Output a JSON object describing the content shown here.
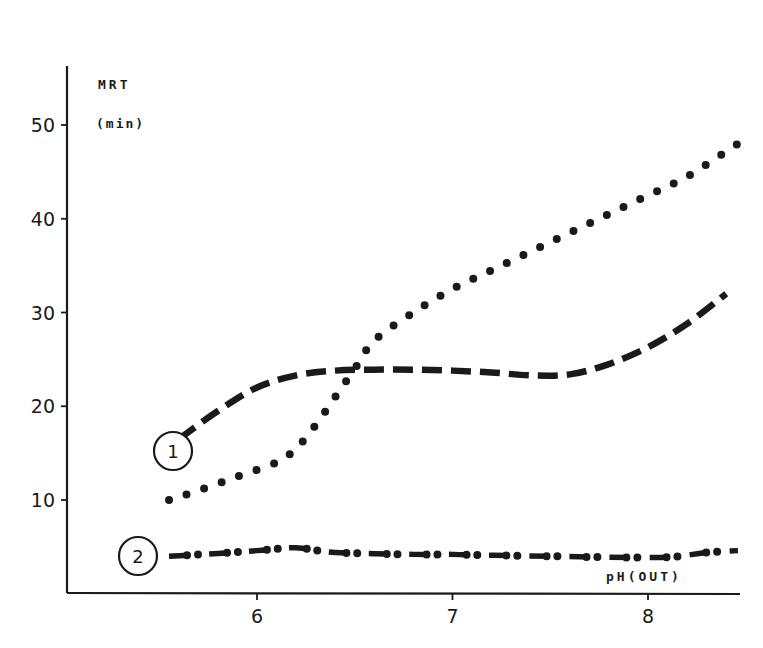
{
  "chart_data": {
    "type": "line",
    "title": "",
    "xlabel": "pH(OUT)",
    "ylabel": "MRT",
    "ylabel_unit": "(min)",
    "xlim": [
      5.05,
      8.5
    ],
    "ylim": [
      0,
      58
    ],
    "x_ticks": [
      6,
      7,
      8
    ],
    "y_ticks": [
      10,
      20,
      30,
      40,
      50
    ],
    "grid": false,
    "legend_position": "inline circled labels",
    "series": [
      {
        "name": "1",
        "style": "dashed",
        "label_at": [
          5.45,
          15.0
        ],
        "points": [
          [
            5.6,
            16.5
          ],
          [
            5.8,
            19.5
          ],
          [
            6.0,
            22.0
          ],
          [
            6.2,
            23.3
          ],
          [
            6.4,
            23.8
          ],
          [
            6.6,
            23.9
          ],
          [
            6.8,
            23.9
          ],
          [
            7.0,
            23.8
          ],
          [
            7.2,
            23.6
          ],
          [
            7.4,
            23.3
          ],
          [
            7.6,
            23.4
          ],
          [
            7.8,
            24.5
          ],
          [
            8.0,
            26.3
          ],
          [
            8.2,
            28.8
          ],
          [
            8.4,
            32.0
          ]
        ]
      },
      {
        "name": "unlabeled (dotted)",
        "style": "dotted",
        "points": [
          [
            5.55,
            10.0
          ],
          [
            5.7,
            11.0
          ],
          [
            5.9,
            12.5
          ],
          [
            6.1,
            14.0
          ],
          [
            6.2,
            15.5
          ],
          [
            6.3,
            18.0
          ],
          [
            6.4,
            21.0
          ],
          [
            6.5,
            24.0
          ],
          [
            6.6,
            27.0
          ],
          [
            6.8,
            30.0
          ],
          [
            7.0,
            32.5
          ],
          [
            7.2,
            34.5
          ],
          [
            7.4,
            36.5
          ],
          [
            7.6,
            38.5
          ],
          [
            7.8,
            40.5
          ],
          [
            8.0,
            42.5
          ],
          [
            8.2,
            44.5
          ],
          [
            8.46,
            48.0
          ]
        ]
      },
      {
        "name": "2",
        "style": "dash-dot",
        "label_at": [
          5.4,
          4.0
        ],
        "points": [
          [
            5.55,
            4.0
          ],
          [
            5.8,
            4.3
          ],
          [
            6.0,
            4.6
          ],
          [
            6.2,
            4.9
          ],
          [
            6.4,
            4.4
          ],
          [
            6.8,
            4.2
          ],
          [
            7.0,
            4.2
          ],
          [
            7.2,
            4.1
          ],
          [
            7.5,
            4.0
          ],
          [
            7.8,
            3.9
          ],
          [
            8.1,
            3.9
          ],
          [
            8.3,
            4.4
          ],
          [
            8.46,
            4.6
          ]
        ]
      }
    ]
  },
  "labels": {
    "y_title": "MRT",
    "y_unit": "(min)",
    "x_title": "pH(OUT)",
    "curve1_marker": "1",
    "curve2_marker": "2"
  },
  "colors": {
    "ink": "#1a1a1a",
    "background": "#ffffff"
  }
}
